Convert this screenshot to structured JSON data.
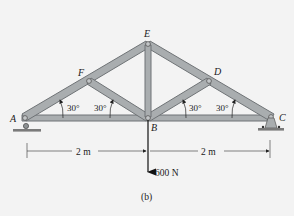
{
  "diagram": {
    "caption": "(b)",
    "joints": {
      "A": {
        "label": "A",
        "x": 24,
        "y": 118
      },
      "B": {
        "label": "B",
        "x": 148,
        "y": 118
      },
      "C": {
        "label": "C",
        "x": 271,
        "y": 117
      },
      "D": {
        "label": "D",
        "x": 209,
        "y": 81
      },
      "E": {
        "label": "E",
        "x": 148,
        "y": 44
      },
      "F": {
        "label": "F",
        "x": 89,
        "y": 81
      }
    },
    "members": [
      "AB",
      "BC",
      "AF",
      "FE",
      "ED",
      "DC",
      "FB",
      "EB",
      "DB"
    ],
    "angles": [
      {
        "label": "30°",
        "at": "A"
      },
      {
        "label": "30°",
        "at": "B-left"
      },
      {
        "label": "30°",
        "at": "B-right"
      },
      {
        "label": "30°",
        "at": "C"
      }
    ],
    "dimensions": [
      {
        "label": "2 m",
        "from": "A",
        "to": "B"
      },
      {
        "label": "2 m",
        "from": "B",
        "to": "C"
      }
    ],
    "load": {
      "label": "600 N",
      "at": "B",
      "direction": "down"
    },
    "supports": {
      "A": "roller",
      "C": "pin"
    },
    "colors": {
      "member_fill": "#a9adaf",
      "member_edge": "#6f7376",
      "ground": "#7a7a7a",
      "background": "#f3f3f3",
      "line": "#222222"
    }
  }
}
